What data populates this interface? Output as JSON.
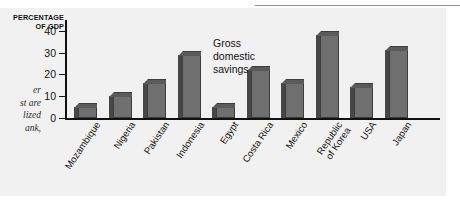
{
  "figure": {
    "axis_caption_line1": "PERCENTAGE",
    "axis_caption_line2": "OF GDP",
    "annotation": "Gross\ndomestic\nsavings"
  },
  "gutter_text": {
    "line1": "er",
    "line2": "st are",
    "line3": "lized",
    "line4": "ank,"
  },
  "colors": {
    "bar_face": "#6f6f6f",
    "bar_side": "#474747",
    "bar_top": "#5a5a5a",
    "outline": "#3c3c3c",
    "panel_background": "#f1f1f1",
    "axis": "#111111"
  },
  "chart_data": {
    "type": "bar",
    "title": "",
    "subtitle": "",
    "annotations": [
      "Gross domestic savings"
    ],
    "xlabel": "",
    "ylabel": "PERCENTAGE OF GDP",
    "ylim": [
      0,
      44
    ],
    "yticks": [
      0,
      10,
      20,
      30,
      40
    ],
    "ytick_labels": [
      "0",
      "10",
      "20",
      "30",
      "40"
    ],
    "grid": false,
    "legend": null,
    "categories": [
      "Mozambique",
      "Nigeria",
      "Pakistan",
      "Indonesia",
      "Egypt",
      "Costa Rica",
      "Mexico",
      "Republic\nof Korea",
      "USA",
      "Japan"
    ],
    "values": [
      5,
      10,
      16,
      29,
      5,
      22,
      16,
      38,
      14,
      31
    ]
  }
}
